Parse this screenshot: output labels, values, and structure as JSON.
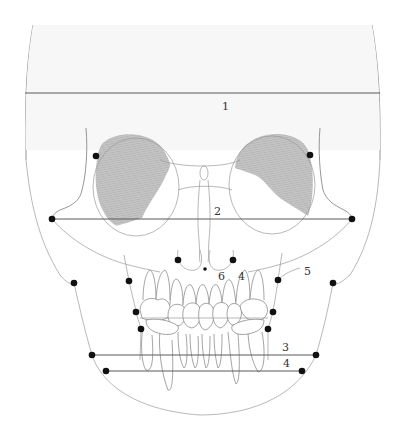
{
  "diagram": {
    "colors": {
      "background": "#ffffff",
      "skull_fill": "#f7f7f7",
      "outline": "#8a8a8a",
      "measurement_line": "#5a5a5a",
      "landmark_point": "#111111",
      "orbit_shading": "#bdbdbd"
    },
    "measurements": [
      {
        "id": "1",
        "label": "1",
        "y": 93,
        "x1": 25,
        "x2": 380
      },
      {
        "id": "2",
        "label": "2",
        "y": 219,
        "x1": 51,
        "x2": 352
      },
      {
        "id": "3",
        "label": "3",
        "y": 355,
        "x1": 92,
        "x2": 316
      },
      {
        "id": "4",
        "label": "4",
        "y": 371,
        "x1": 106,
        "x2": 302
      },
      {
        "id": "5",
        "label": "5"
      },
      {
        "id": "6",
        "label": "6"
      }
    ],
    "labels": {
      "l1": "1",
      "l2": "2",
      "l3": "3",
      "l4": "4",
      "l4b": "4",
      "l5": "5",
      "l6": "6"
    },
    "landmarks": [
      {
        "name": "left-zygion-upper",
        "x": 96,
        "y": 156
      },
      {
        "name": "right-zygion-upper",
        "x": 310,
        "y": 155
      },
      {
        "name": "left-zygion",
        "x": 52,
        "y": 219
      },
      {
        "name": "right-zygion",
        "x": 352,
        "y": 219
      },
      {
        "name": "left-nasal-alar",
        "x": 178,
        "y": 260
      },
      {
        "name": "right-nasal-alar",
        "x": 233,
        "y": 260
      },
      {
        "name": "anterior-nasal-spine",
        "x": 205,
        "y": 269
      },
      {
        "name": "left-maxilla",
        "x": 129,
        "y": 281
      },
      {
        "name": "right-maxilla",
        "x": 278,
        "y": 280
      },
      {
        "name": "left-gonion-outer",
        "x": 74,
        "y": 283
      },
      {
        "name": "right-gonion-outer",
        "x": 333,
        "y": 283
      },
      {
        "name": "left-molar-upper",
        "x": 136,
        "y": 312
      },
      {
        "name": "right-molar-upper",
        "x": 273,
        "y": 312
      },
      {
        "name": "left-molar-lower",
        "x": 141,
        "y": 329
      },
      {
        "name": "right-molar-lower",
        "x": 268,
        "y": 329
      },
      {
        "name": "left-gonion",
        "x": 92,
        "y": 355
      },
      {
        "name": "right-gonion",
        "x": 316,
        "y": 355
      },
      {
        "name": "left-mandible",
        "x": 106,
        "y": 371
      },
      {
        "name": "right-mandible",
        "x": 302,
        "y": 371
      }
    ]
  }
}
